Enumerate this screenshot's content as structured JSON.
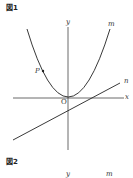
{
  "figure1": {
    "title": "図1",
    "labels": {
      "y": "y",
      "x": "x",
      "m": "m",
      "n": "n",
      "p": "P",
      "origin": "O"
    }
  },
  "figure2": {
    "title": "図2",
    "labels": {
      "y": "y",
      "m": "m"
    }
  },
  "colors": {
    "line": "#333333",
    "background": "#ffffff"
  }
}
